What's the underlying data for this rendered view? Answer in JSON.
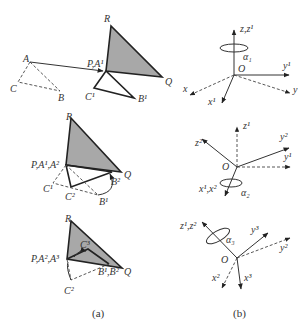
{
  "figure": {
    "panel_a": {
      "caption": "(a)",
      "step1": {
        "labels": {
          "R": "R",
          "Q": "Q",
          "PA1": "P,A¹",
          "A": "A",
          "B": "B",
          "C": "C",
          "B1": "B¹",
          "C1": "C¹"
        }
      },
      "step2": {
        "labels": {
          "R": "R",
          "Q": "Q",
          "PA": "P,A¹,A²",
          "C1": "C¹",
          "C2": "C²",
          "B1": "B¹",
          "B2": "B²"
        }
      },
      "step3": {
        "labels": {
          "R": "R",
          "Q": "Q",
          "PA": "P,A²,A³",
          "C3": "C³",
          "C2": "C²",
          "B12": "B¹,B²"
        }
      }
    },
    "panel_b": {
      "caption": "(b)",
      "frame1": {
        "labels": {
          "z": "z,z¹",
          "alpha": "α₁",
          "O": "O",
          "y1": "y¹",
          "y": "y",
          "x": "x",
          "x1": "x¹"
        }
      },
      "frame2": {
        "labels": {
          "z1": "z¹",
          "z2": "z²",
          "y2": "y²",
          "y1": "y¹",
          "O": "O",
          "x": "x¹,x²",
          "alpha": "α₂"
        }
      },
      "frame3": {
        "labels": {
          "z": "z¹,z²",
          "alpha": "α₃",
          "y3": "y³",
          "y2": "y²",
          "O": "O",
          "x2": "x²",
          "x3": "x³"
        }
      }
    }
  }
}
